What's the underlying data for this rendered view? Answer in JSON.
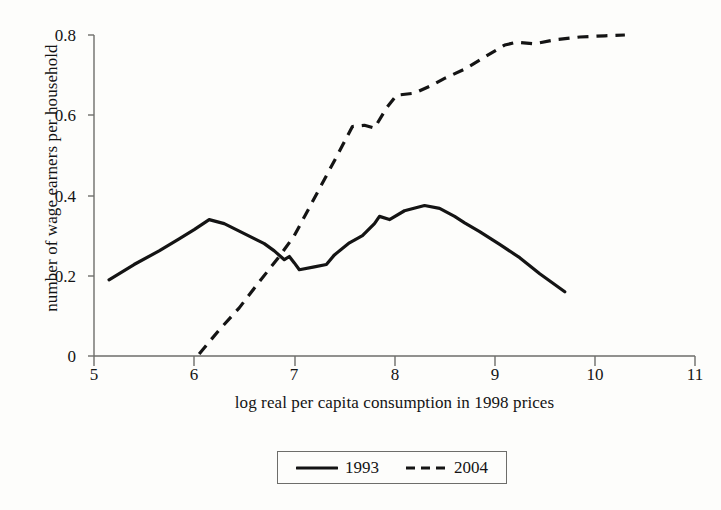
{
  "figure": {
    "background_color": "#fdfdfb",
    "ink_color": "#141414",
    "axis_color": "#6d6d6a"
  },
  "axes": {
    "x": {
      "label": "log real per capita consumption in 1998 prices",
      "ticks": [
        "5",
        "6",
        "7",
        "8",
        "9",
        "10",
        "11"
      ],
      "min": 5,
      "max": 11
    },
    "y": {
      "label": "number of wage earners per household",
      "ticks": [
        "0",
        "0.2",
        "0.4",
        "0.6",
        "0.8"
      ],
      "min": 0,
      "max": 0.8
    }
  },
  "legend": {
    "entries": [
      {
        "label": "1993",
        "style": "solid",
        "color": "#141414"
      },
      {
        "label": "2004",
        "style": "dashed",
        "color": "#141414"
      }
    ]
  },
  "chart_data": {
    "type": "line",
    "title": "",
    "xlabel": "log real per capita consumption in 1998 prices",
    "ylabel": "number of wage earners per household",
    "xlim": [
      5,
      11
    ],
    "ylim": [
      0,
      0.8
    ],
    "xticks": [
      5,
      6,
      7,
      8,
      9,
      10,
      11
    ],
    "yticks": [
      0,
      0.2,
      0.4,
      0.6,
      0.8
    ],
    "grid": false,
    "legend_position": "below-axis-centered",
    "series": [
      {
        "name": "1993",
        "style": "solid",
        "color": "#141414",
        "points": [
          [
            5.15,
            0.19
          ],
          [
            5.4,
            0.228
          ],
          [
            5.65,
            0.262
          ],
          [
            5.85,
            0.292
          ],
          [
            6.0,
            0.315
          ],
          [
            6.15,
            0.34
          ],
          [
            6.3,
            0.33
          ],
          [
            6.5,
            0.305
          ],
          [
            6.7,
            0.28
          ],
          [
            6.8,
            0.262
          ],
          [
            6.9,
            0.24
          ],
          [
            6.95,
            0.248
          ],
          [
            7.0,
            0.232
          ],
          [
            7.05,
            0.215
          ],
          [
            7.2,
            0.222
          ],
          [
            7.32,
            0.228
          ],
          [
            7.4,
            0.252
          ],
          [
            7.55,
            0.282
          ],
          [
            7.68,
            0.3
          ],
          [
            7.8,
            0.33
          ],
          [
            7.85,
            0.348
          ],
          [
            7.95,
            0.34
          ],
          [
            8.1,
            0.362
          ],
          [
            8.3,
            0.375
          ],
          [
            8.45,
            0.368
          ],
          [
            8.6,
            0.348
          ],
          [
            8.7,
            0.332
          ],
          [
            8.85,
            0.31
          ],
          [
            9.05,
            0.278
          ],
          [
            9.25,
            0.245
          ],
          [
            9.45,
            0.205
          ],
          [
            9.7,
            0.16
          ]
        ]
      },
      {
        "name": "2004",
        "style": "dashed",
        "color": "#141414",
        "points": [
          [
            6.05,
            0.005
          ],
          [
            6.25,
            0.065
          ],
          [
            6.45,
            0.12
          ],
          [
            6.65,
            0.185
          ],
          [
            6.85,
            0.248
          ],
          [
            7.0,
            0.3
          ],
          [
            7.15,
            0.37
          ],
          [
            7.3,
            0.44
          ],
          [
            7.45,
            0.51
          ],
          [
            7.58,
            0.572
          ],
          [
            7.7,
            0.575
          ],
          [
            7.8,
            0.568
          ],
          [
            7.92,
            0.618
          ],
          [
            8.02,
            0.65
          ],
          [
            8.2,
            0.655
          ],
          [
            8.35,
            0.672
          ],
          [
            8.5,
            0.692
          ],
          [
            8.7,
            0.715
          ],
          [
            8.9,
            0.745
          ],
          [
            9.1,
            0.775
          ],
          [
            9.22,
            0.782
          ],
          [
            9.4,
            0.778
          ],
          [
            9.6,
            0.788
          ],
          [
            9.85,
            0.795
          ],
          [
            10.1,
            0.798
          ],
          [
            10.3,
            0.8
          ]
        ]
      }
    ]
  }
}
